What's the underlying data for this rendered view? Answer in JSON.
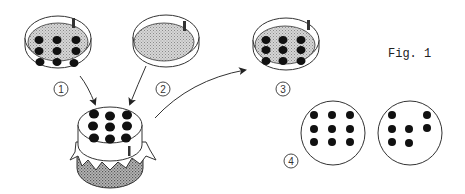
{
  "figure": {
    "label": "Fig. 1",
    "colors": {
      "stroke": "#333333",
      "dot": "#111111",
      "medium": "#c8c8c8",
      "background": "#ffffff"
    },
    "steps": [
      {
        "id": "1",
        "label": "1",
        "description": "Petri dish with 3x3 grid of colonies"
      },
      {
        "id": "2",
        "label": "2",
        "description": "Petri dish with uniform medium (no colonies)"
      },
      {
        "id": "3",
        "label": "3",
        "description": "Replica plate with 3x3 grid of colonies"
      },
      {
        "id": "4",
        "label": "4",
        "description": "Two plates compared: full 3x3 grid vs. partial grid"
      }
    ],
    "center_object": "Velvet-covered block (replica plating stamp) with 3x3 colony imprint",
    "plate_4a_dots": 9,
    "plate_4b_dots": 6
  }
}
